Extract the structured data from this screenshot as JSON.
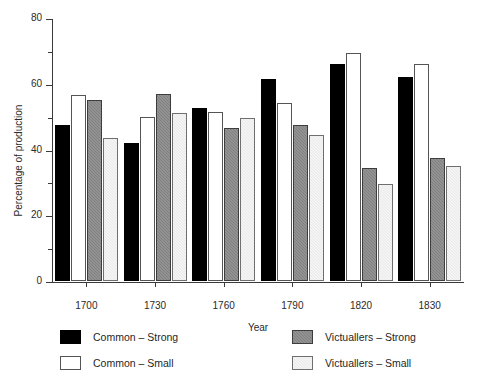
{
  "chart_data": {
    "type": "bar",
    "title": "",
    "xlabel": "Year",
    "ylabel": "Percentage of production",
    "categories": [
      "1700",
      "1730",
      "1760",
      "1790",
      "1820",
      "1830"
    ],
    "ylim": [
      0,
      80
    ],
    "ytick_labels": [
      "0",
      "20",
      "40",
      "60",
      "80"
    ],
    "ytick_values": [
      0,
      20,
      40,
      60,
      80
    ],
    "yminor_tick_values": [
      10,
      30,
      50,
      70
    ],
    "grid": false,
    "legend_position": "bottom",
    "series": [
      {
        "name": "Common – Strong",
        "color": "#000000",
        "values": [
          47.5,
          42,
          52.5,
          61.5,
          66,
          62
        ]
      },
      {
        "name": "Common – Small",
        "color": "#ffffff",
        "values": [
          56.5,
          50,
          51.5,
          54,
          69.5,
          66
        ]
      },
      {
        "name": "Victuallers – Strong",
        "color": "#808080",
        "values": [
          55,
          57,
          46.5,
          47.5,
          34.5,
          37.5
        ]
      },
      {
        "name": "Victuallers – Small",
        "color": "#e9e9e9",
        "values": [
          43.5,
          51,
          49.5,
          44.5,
          29.5,
          35
        ]
      }
    ]
  }
}
